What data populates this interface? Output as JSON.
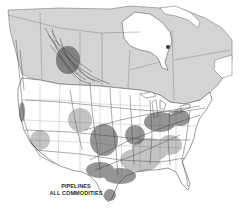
{
  "map": {
    "title_line1": "PIPELINES",
    "title_line2": "ALL COMMODITIES",
    "colors": {
      "canada_fill": "#d4d4d4",
      "us_fill": "#ffffff",
      "water": "#ffffff",
      "border": "#6e6e6e",
      "pipeline": "#3a3a3a"
    },
    "regions": [
      "Canada",
      "United States",
      "Hudson Bay",
      "Great Lakes",
      "Gulf of Mexico"
    ]
  }
}
